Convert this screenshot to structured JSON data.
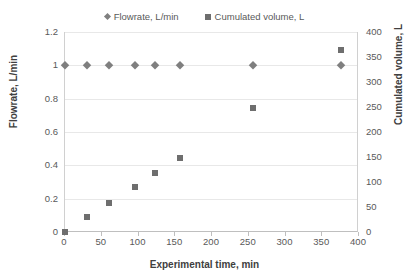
{
  "chart_data": {
    "type": "scatter",
    "title": "",
    "xlabel": "Experimental time, min",
    "ylabel": "Flowrate, L/min",
    "y2label": "Cumulated volume, L",
    "xlim": [
      0,
      400
    ],
    "ylim": [
      0,
      1.2
    ],
    "y2lim": [
      0,
      400
    ],
    "grid": true,
    "legend_position": "top",
    "xticks": [
      "0",
      "50",
      "100",
      "150",
      "200",
      "250",
      "300",
      "350",
      "400"
    ],
    "yticks": [
      "0",
      "0.2",
      "0.4",
      "0.6",
      "0.8",
      "1",
      "1.2"
    ],
    "y2ticks": [
      "0",
      "50",
      "100",
      "150",
      "200",
      "250",
      "300",
      "350",
      "400"
    ],
    "x": [
      0,
      30,
      60,
      95,
      122,
      156,
      256,
      375
    ],
    "series": [
      {
        "name": "Flowrate, L/min",
        "axis": "left",
        "marker": "diamond",
        "color": "#7f7f7f",
        "values": [
          1.0,
          1.0,
          1.0,
          1.0,
          1.0,
          1.0,
          1.0,
          1.0
        ]
      },
      {
        "name": "Cumulated volume, L",
        "axis": "right",
        "marker": "square",
        "color": "#6e6e6e",
        "values": [
          0,
          30,
          58,
          90,
          118,
          148,
          248,
          365
        ]
      }
    ]
  },
  "legend": {
    "entries": [
      {
        "label": "Flowrate, L/min",
        "marker": "diamond-marker-icon"
      },
      {
        "label": "Cumulated volume, L",
        "marker": "square-marker-icon"
      }
    ]
  },
  "axes": {
    "x_title": "Experimental time, min",
    "y_left_title": "Flowrate, L/min",
    "y_right_title": "Cumulated volume, L"
  },
  "colors": {
    "marker_flowrate": "#7f7f7f",
    "marker_volume": "#6e6e6e",
    "gridline": "#e8e8e8",
    "axis": "#bfbfbf",
    "text": "#595959",
    "title_text": "#404040",
    "background": "#ffffff"
  }
}
